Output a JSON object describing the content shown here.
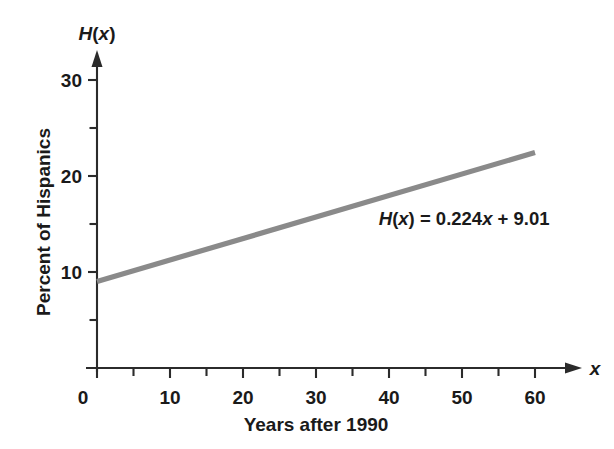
{
  "chart_data": {
    "type": "line",
    "title": "",
    "subtitle": "",
    "xlabel": "Years after 1990",
    "ylabel": "Percent of Hispanics",
    "x_axis_symbol": "x",
    "y_axis_symbol": "H(x)",
    "xlim": [
      0,
      63
    ],
    "ylim": [
      0,
      32
    ],
    "grid": false,
    "legend": null,
    "x_ticks_major": [
      0,
      10,
      20,
      30,
      40,
      50,
      60
    ],
    "x_tick_labels": [
      "0",
      "10",
      "20",
      "30",
      "40",
      "50",
      "60"
    ],
    "x_ticks_minor": [
      5,
      15,
      25,
      35,
      45,
      55
    ],
    "y_ticks_major": [
      10,
      20,
      30
    ],
    "y_tick_labels": [
      "10",
      "20",
      "30"
    ],
    "y_ticks_minor": [
      5,
      15,
      25
    ],
    "annotations": [
      {
        "name": "equation-label",
        "parts": [
          {
            "text": "H",
            "italic": true
          },
          {
            "text": "(",
            "italic": false
          },
          {
            "text": "x",
            "italic": true
          },
          {
            "text": ") = 0.224",
            "italic": false
          },
          {
            "text": "x",
            "italic": true
          },
          {
            "text": " + 9.01",
            "italic": false
          }
        ],
        "plain_text": "H(x) = 0.224x + 9.01",
        "x": 38.6,
        "y": 14.9
      }
    ],
    "series": [
      {
        "name": "H(x) = 0.224x + 9.01",
        "color": "#8a8a8a",
        "slope": 0.224,
        "intercept": 9.01,
        "x": [
          0,
          60
        ],
        "values": [
          9.01,
          22.45
        ]
      }
    ]
  },
  "axis_colors": {
    "axis": "#2b2b2b",
    "line": "#8a8a8a",
    "background": "#ffffff",
    "text": "#1a1a1a"
  }
}
